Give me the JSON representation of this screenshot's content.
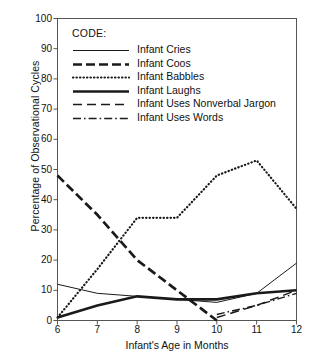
{
  "chart_data": {
    "type": "line",
    "title": "",
    "xlabel": "Infant's Age in Months",
    "ylabel": "Percentage of Observational Cycles",
    "x": [
      6,
      7,
      8,
      9,
      10,
      11,
      12
    ],
    "xlim": [
      6,
      12
    ],
    "ylim": [
      0,
      100
    ],
    "xticks": [
      "6",
      "7",
      "8",
      "9",
      "10",
      "11",
      "12"
    ],
    "yticks": [
      "0",
      "10",
      "20",
      "30",
      "40",
      "50",
      "60",
      "70",
      "80",
      "90",
      "100"
    ],
    "grid": false,
    "legend_position": "upper-left-inside",
    "legend_title": "CODE:",
    "series": [
      {
        "name": "Infant Cries",
        "style": "solid-thin",
        "values": [
          12,
          9,
          8,
          7,
          6,
          9,
          19
        ]
      },
      {
        "name": "Infant Coos",
        "style": "dashed-thick",
        "values": [
          48,
          35,
          20,
          10,
          0,
          null,
          null
        ]
      },
      {
        "name": "Infant Babbles",
        "style": "dotted",
        "values": [
          1,
          17,
          34,
          34,
          48,
          53,
          37
        ]
      },
      {
        "name": "Infant Laughs",
        "style": "solid-thick",
        "values": [
          1,
          5,
          8,
          7,
          7,
          9,
          10
        ]
      },
      {
        "name": "Infant Uses Nonverbal Jargon",
        "style": "dashed-long",
        "values": [
          null,
          null,
          null,
          null,
          1,
          5,
          10
        ]
      },
      {
        "name": "Infant Uses Words",
        "style": "dash-dot",
        "values": [
          null,
          null,
          null,
          null,
          2,
          5,
          9
        ]
      }
    ]
  },
  "axes": {
    "y_label": "Percentage of Observational Cycles",
    "x_label": "Infant's Age in Months",
    "y_ticks": [
      "100",
      "90",
      "80",
      "70",
      "60",
      "50",
      "40",
      "30",
      "20",
      "10",
      "0"
    ],
    "x_ticks": [
      "6",
      "7",
      "8",
      "9",
      "10",
      "11",
      "12"
    ]
  },
  "legend": {
    "title": "CODE:",
    "items": [
      {
        "label": "Infant Cries"
      },
      {
        "label": "Infant Coos"
      },
      {
        "label": "Infant Babbles"
      },
      {
        "label": "Infant Laughs"
      },
      {
        "label": "Infant Uses Nonverbal Jargon"
      },
      {
        "label": "Infant Uses Words"
      }
    ]
  },
  "colors": {
    "ink": "#1a1a1a",
    "frame": "#555555",
    "background": "#ffffff"
  }
}
